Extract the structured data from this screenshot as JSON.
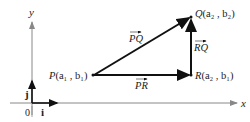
{
  "diagram": {
    "axes": {
      "x_label": "x",
      "y_label": "y",
      "origin_label": "0"
    },
    "unit_vectors": {
      "i_label": "i",
      "j_label": "j"
    },
    "points": {
      "P": {
        "name": "P",
        "coords": "(a₁ , b₁)"
      },
      "Q": {
        "name": "Q",
        "coords": "(a₂ , b₂)"
      },
      "R": {
        "name": "R",
        "coords": "(a₂ , b₁)"
      }
    },
    "vectors": {
      "PQ": "PQ",
      "PR": "PR",
      "RQ": "RQ"
    },
    "colors": {
      "axis": "#888888",
      "vector": "#111111",
      "text": "#222222"
    }
  }
}
